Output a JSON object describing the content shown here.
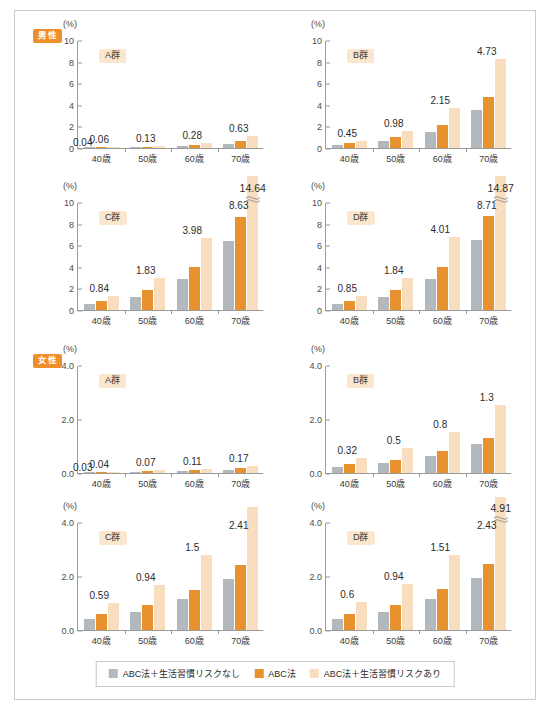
{
  "legend": {
    "items": [
      {
        "label": "ABC法＋生活習慣リスクなし",
        "color": "#b3b8bd",
        "key": "no_risk"
      },
      {
        "label": "ABC法",
        "color": "#e8912f",
        "key": "abc"
      },
      {
        "label": "ABC法＋生活習慣リスクあり",
        "color": "#f8ddbe",
        "key": "with_risk"
      }
    ]
  },
  "sections": [
    {
      "key": "male",
      "badge": "男性",
      "badge_color": "#ef8f2b"
    },
    {
      "key": "female",
      "badge": "女性",
      "badge_color": "#ef8f2b"
    }
  ],
  "axis": {
    "unit": "(%)",
    "male_ticks": [
      "0",
      "2",
      "4",
      "6",
      "8",
      "10"
    ],
    "female_ticks": [
      "0.0",
      "2.0",
      "4.0"
    ],
    "categories": [
      "40歳",
      "50歳",
      "60歳",
      "70歳"
    ]
  },
  "chart_data": [
    {
      "type": "bar",
      "id": "male-A",
      "title": "A群",
      "section": "男性",
      "ylabel": "(%)",
      "xlabel": "",
      "ylim": [
        0,
        10
      ],
      "yticks": [
        0,
        2,
        4,
        6,
        8,
        10
      ],
      "grid": false,
      "legend_position": "bottom",
      "categories": [
        "40歳",
        "50歳",
        "60歳",
        "70歳"
      ],
      "series": [
        {
          "name": "ABC法＋生活習慣リスクなし",
          "color": "#b3b8bd",
          "values": [
            0.03,
            0.07,
            0.16,
            0.36
          ]
        },
        {
          "name": "ABC法",
          "color": "#e8912f",
          "values": [
            0.04,
            0.13,
            0.28,
            0.63
          ]
        },
        {
          "name": "ABC法＋生活習慣リスクあり",
          "color": "#f8ddbe",
          "values": [
            0.06,
            0.22,
            0.48,
            1.09
          ]
        }
      ],
      "annotations": [
        {
          "text": "0.04",
          "category": "40歳",
          "placement": "left-low"
        },
        {
          "text": "0.06",
          "category": "40歳",
          "placement": "above"
        },
        {
          "text": "0.13",
          "category": "50歳",
          "placement": "above"
        },
        {
          "text": "0.28",
          "category": "60歳",
          "placement": "above"
        },
        {
          "text": "0.63",
          "category": "70歳",
          "placement": "above"
        }
      ]
    },
    {
      "type": "bar",
      "id": "male-B",
      "title": "B群",
      "section": "男性",
      "ylabel": "(%)",
      "xlabel": "",
      "ylim": [
        0,
        10
      ],
      "yticks": [
        0,
        2,
        4,
        6,
        8,
        10
      ],
      "grid": false,
      "legend_position": "bottom",
      "categories": [
        "40歳",
        "50歳",
        "60歳",
        "70歳"
      ],
      "series": [
        {
          "name": "ABC法＋生活習慣リスクなし",
          "color": "#b3b8bd",
          "values": [
            0.26,
            0.66,
            1.52,
            3.54
          ]
        },
        {
          "name": "ABC法",
          "color": "#e8912f",
          "values": [
            0.45,
            0.98,
            2.15,
            4.73
          ]
        },
        {
          "name": "ABC法＋生活習慣リスクあり",
          "color": "#f8ddbe",
          "values": [
            0.68,
            1.58,
            3.7,
            8.28
          ]
        }
      ],
      "annotations": [
        {
          "text": "0.45",
          "category": "40歳",
          "placement": "above"
        },
        {
          "text": "0.98",
          "category": "50歳",
          "placement": "above"
        },
        {
          "text": "2.15",
          "category": "60歳",
          "placement": "above"
        },
        {
          "text": "4.73",
          "category": "70歳",
          "placement": "above"
        }
      ]
    },
    {
      "type": "bar",
      "id": "male-C",
      "title": "C群",
      "section": "男性",
      "ylabel": "(%)",
      "xlabel": "",
      "ylim": [
        0,
        10
      ],
      "yticks": [
        0,
        2,
        4,
        6,
        8,
        10
      ],
      "grid": false,
      "legend_position": "bottom",
      "categories": [
        "40歳",
        "50歳",
        "60歳",
        "70歳"
      ],
      "axis_break": {
        "category": "70歳",
        "series": "ABC法＋生活習慣リスクあり",
        "true_value": 14.64
      },
      "series": [
        {
          "name": "ABC法＋生活習慣リスクなし",
          "color": "#b3b8bd",
          "values": [
            0.52,
            1.24,
            2.83,
            6.36
          ]
        },
        {
          "name": "ABC法",
          "color": "#e8912f",
          "values": [
            0.84,
            1.83,
            3.98,
            8.63
          ]
        },
        {
          "name": "ABC法＋生活習慣リスクあり",
          "color": "#f8ddbe",
          "values": [
            1.33,
            2.97,
            6.63,
            14.64
          ]
        }
      ],
      "annotations": [
        {
          "text": "0.84",
          "category": "40歳",
          "placement": "above"
        },
        {
          "text": "1.83",
          "category": "50歳",
          "placement": "above"
        },
        {
          "text": "3.98",
          "category": "60歳",
          "placement": "above"
        },
        {
          "text": "8.63",
          "category": "70歳",
          "placement": "above"
        },
        {
          "text": "14.64",
          "category": "70歳",
          "placement": "top-overflow"
        }
      ]
    },
    {
      "type": "bar",
      "id": "male-D",
      "title": "D群",
      "section": "男性",
      "ylabel": "(%)",
      "xlabel": "",
      "ylim": [
        0,
        10
      ],
      "yticks": [
        0,
        2,
        4,
        6,
        8,
        10
      ],
      "grid": false,
      "legend_position": "bottom",
      "categories": [
        "40歳",
        "50歳",
        "60歳",
        "70歳"
      ],
      "axis_break": {
        "category": "70歳",
        "series": "ABC法＋生活習慣リスクあり",
        "true_value": 14.87
      },
      "series": [
        {
          "name": "ABC法＋生活習慣リスクなし",
          "color": "#b3b8bd",
          "values": [
            0.54,
            1.25,
            2.85,
            6.47
          ]
        },
        {
          "name": "ABC法",
          "color": "#e8912f",
          "values": [
            0.85,
            1.84,
            4.01,
            8.71
          ]
        },
        {
          "name": "ABC法＋生活習慣リスクあり",
          "color": "#f8ddbe",
          "values": [
            1.34,
            3.0,
            6.74,
            14.87
          ]
        }
      ],
      "annotations": [
        {
          "text": "0.85",
          "category": "40歳",
          "placement": "above"
        },
        {
          "text": "1.84",
          "category": "50歳",
          "placement": "above"
        },
        {
          "text": "4.01",
          "category": "60歳",
          "placement": "above"
        },
        {
          "text": "8.71",
          "category": "70歳",
          "placement": "above"
        },
        {
          "text": "14.87",
          "category": "70歳",
          "placement": "top-overflow"
        }
      ]
    },
    {
      "type": "bar",
      "id": "female-A",
      "title": "A群",
      "section": "女性",
      "ylabel": "(%)",
      "xlabel": "",
      "ylim": [
        0,
        4
      ],
      "yticks": [
        0.0,
        2.0,
        4.0
      ],
      "grid": false,
      "legend_position": "bottom",
      "categories": [
        "40歳",
        "50歳",
        "60歳",
        "70歳"
      ],
      "series": [
        {
          "name": "ABC法＋生活習慣リスクなし",
          "color": "#b3b8bd",
          "values": [
            0.02,
            0.04,
            0.07,
            0.11
          ]
        },
        {
          "name": "ABC法",
          "color": "#e8912f",
          "values": [
            0.03,
            0.07,
            0.11,
            0.17
          ]
        },
        {
          "name": "ABC法＋生活習慣リスクあり",
          "color": "#f8ddbe",
          "values": [
            0.04,
            0.1,
            0.16,
            0.25
          ]
        }
      ],
      "annotations": [
        {
          "text": "0.03",
          "category": "40歳",
          "placement": "left-low"
        },
        {
          "text": "0.04",
          "category": "40歳",
          "placement": "above"
        },
        {
          "text": "0.07",
          "category": "50歳",
          "placement": "above"
        },
        {
          "text": "0.11",
          "category": "60歳",
          "placement": "above"
        },
        {
          "text": "0.17",
          "category": "70歳",
          "placement": "above"
        }
      ]
    },
    {
      "type": "bar",
      "id": "female-B",
      "title": "B群",
      "section": "女性",
      "ylabel": "(%)",
      "xlabel": "",
      "ylim": [
        0,
        4
      ],
      "yticks": [
        0.0,
        2.0,
        4.0
      ],
      "grid": false,
      "legend_position": "bottom",
      "categories": [
        "40歳",
        "50歳",
        "60歳",
        "70歳"
      ],
      "series": [
        {
          "name": "ABC法＋生活習慣リスクなし",
          "color": "#b3b8bd",
          "values": [
            0.23,
            0.37,
            0.63,
            1.06
          ]
        },
        {
          "name": "ABC法",
          "color": "#e8912f",
          "values": [
            0.32,
            0.5,
            0.8,
            1.3
          ]
        },
        {
          "name": "ABC法＋生活習慣リスクあり",
          "color": "#f8ddbe",
          "values": [
            0.55,
            0.92,
            1.53,
            2.53
          ]
        }
      ],
      "annotations": [
        {
          "text": "0.32",
          "category": "40歳",
          "placement": "above"
        },
        {
          "text": "0.5",
          "category": "50歳",
          "placement": "above"
        },
        {
          "text": "0.8",
          "category": "60歳",
          "placement": "above"
        },
        {
          "text": "1.3",
          "category": "70歳",
          "placement": "above"
        }
      ]
    },
    {
      "type": "bar",
      "id": "female-C",
      "title": "C群",
      "section": "女性",
      "ylabel": "(%)",
      "xlabel": "",
      "ylim": [
        0,
        4
      ],
      "yticks": [
        0.0,
        2.0,
        4.0
      ],
      "grid": false,
      "legend_position": "bottom",
      "categories": [
        "40歳",
        "50歳",
        "60歳",
        "70歳"
      ],
      "series": [
        {
          "name": "ABC法＋生活習慣リスクなし",
          "color": "#b3b8bd",
          "values": [
            0.41,
            0.67,
            1.14,
            1.9
          ]
        },
        {
          "name": "ABC法",
          "color": "#e8912f",
          "values": [
            0.59,
            0.94,
            1.5,
            2.41
          ]
        },
        {
          "name": "ABC法＋生活習慣リスクあり",
          "color": "#f8ddbe",
          "values": [
            1.0,
            1.67,
            2.76,
            4.55
          ]
        }
      ],
      "annotations": [
        {
          "text": "0.59",
          "category": "40歳",
          "placement": "above"
        },
        {
          "text": "0.94",
          "category": "50歳",
          "placement": "above"
        },
        {
          "text": "1.5",
          "category": "60歳",
          "placement": "above"
        },
        {
          "text": "2.41",
          "category": "70歳",
          "placement": "above"
        }
      ]
    },
    {
      "type": "bar",
      "id": "female-D",
      "title": "D群",
      "section": "女性",
      "ylabel": "(%)",
      "xlabel": "",
      "ylim": [
        0,
        4
      ],
      "yticks": [
        0.0,
        2.0,
        4.0
      ],
      "grid": false,
      "legend_position": "bottom",
      "categories": [
        "40歳",
        "50歳",
        "60歳",
        "70歳"
      ],
      "series": [
        {
          "name": "ABC法＋生活習慣リスクなし",
          "color": "#b3b8bd",
          "values": [
            0.41,
            0.67,
            1.15,
            1.92
          ]
        },
        {
          "name": "ABC法",
          "color": "#e8912f",
          "values": [
            0.6,
            0.94,
            1.51,
            2.43
          ]
        },
        {
          "name": "ABC法＋生活習慣リスクあり",
          "color": "#f8ddbe",
          "values": [
            1.02,
            1.69,
            2.79,
            4.91
          ]
        }
      ],
      "annotations": [
        {
          "text": "0.6",
          "category": "40歳",
          "placement": "above"
        },
        {
          "text": "0.94",
          "category": "50歳",
          "placement": "above"
        },
        {
          "text": "1.51",
          "category": "60歳",
          "placement": "above"
        },
        {
          "text": "2.43",
          "category": "70歳",
          "placement": "above"
        },
        {
          "text": "4.91",
          "category": "70歳",
          "placement": "top-overflow"
        }
      ]
    }
  ]
}
